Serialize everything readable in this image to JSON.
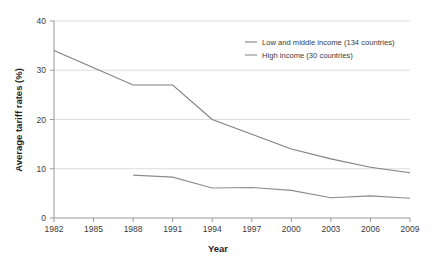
{
  "chart_data": {
    "type": "line",
    "title": "",
    "xlabel": "Year",
    "ylabel": "Average tariff rates (%)",
    "x": [
      1982,
      1985,
      1988,
      1991,
      1994,
      1997,
      2000,
      2003,
      2006,
      2009
    ],
    "xlim": [
      1982,
      2009
    ],
    "ylim": [
      0,
      40
    ],
    "xticks": [
      "1982",
      "1985",
      "1988",
      "1991",
      "1994",
      "1997",
      "2000",
      "2003",
      "2006",
      "2009"
    ],
    "yticks": [
      "0",
      "10",
      "20",
      "30",
      "40"
    ],
    "grid": "horizontal",
    "legend_position": "top-right",
    "series": [
      {
        "name": "Low and middle income (134 countries)",
        "color": "#808080",
        "x": [
          1982,
          1985,
          1988,
          1991,
          1994,
          1997,
          2000,
          2003,
          2006,
          2009
        ],
        "values": [
          34.0,
          30.5,
          27.0,
          27.0,
          20.0,
          17.0,
          14.0,
          12.0,
          10.3,
          9.2
        ]
      },
      {
        "name": "High income (30 countries)",
        "color": "#8c8c8c",
        "x": [
          1988,
          1991,
          1994,
          1997,
          2000,
          2003,
          2006,
          2009
        ],
        "values": [
          8.7,
          8.3,
          6.1,
          6.2,
          5.6,
          4.1,
          4.5,
          4.0
        ]
      }
    ]
  },
  "axes": {
    "y_title": "Average tariff rates (%)",
    "x_title": "Year"
  },
  "legend": {
    "entries": [
      {
        "label": "Low and middle income (134 countries)"
      },
      {
        "label": "High income (30 countries)"
      }
    ]
  },
  "colors": {
    "series_low_middle": "#808080",
    "series_high": "#8c8c8c",
    "grid": "#d4d4d4",
    "axis": "#9a9a9a",
    "text": "#3a3a3a"
  }
}
